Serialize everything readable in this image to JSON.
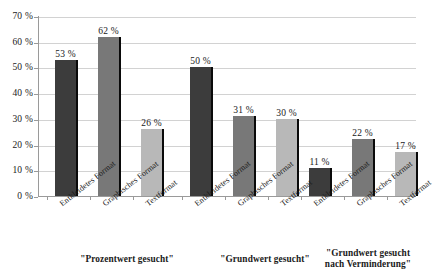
{
  "chart_data": {
    "type": "bar",
    "title": "",
    "subtitle": "",
    "xlabel": "",
    "ylabel": "",
    "ylim": [
      0,
      70
    ],
    "y_tick_step": 10,
    "grid": true,
    "legend": "none",
    "y_ticks": [
      "0 %",
      "10 %",
      "20 %",
      "30 %",
      "40 %",
      "50 %",
      "60 %",
      "70 %"
    ],
    "categories": [
      "Entkleidetes Format",
      "Graphisches Format",
      "Textformat"
    ],
    "groups": [
      {
        "label": "\"Prozentwert gesucht\"",
        "values": [
          53,
          62,
          26
        ],
        "value_labels": [
          "53 %",
          "62 %",
          "26 %"
        ]
      },
      {
        "label": "\"Grundwert gesucht\"",
        "values": [
          50,
          31,
          30
        ],
        "value_labels": [
          "50 %",
          "31 %",
          "30 %"
        ]
      },
      {
        "label": "\"Grundwert gesucht\nnach Verminderung\"",
        "values": [
          11,
          22,
          17
        ],
        "value_labels": [
          "11 %",
          "22 %",
          "17 %"
        ]
      }
    ],
    "series_tones": [
      "tone-dark",
      "tone-medium",
      "tone-light"
    ],
    "colors": {
      "bar_dark": "#3c3c3c",
      "bar_medium": "#787878",
      "bar_light": "#b8b8b8",
      "bar_edge": "#0a0a0a",
      "gridline": "#d2d2d2",
      "axis": "#9a9a9a",
      "text": "#1a1a1a",
      "background": "#ffffff"
    }
  }
}
